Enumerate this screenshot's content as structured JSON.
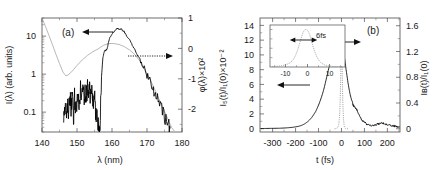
{
  "figure": {
    "background": "#ffffff",
    "curve_color_main": "#000000",
    "curve_color_secondary": "#9a9a9a"
  },
  "panel_a": {
    "label": "(a)",
    "arrow_left_label": "arrow-to-left-axis",
    "arrow_right_label": "arrow-to-right-axis"
  },
  "panel_b": {
    "label": "(b)",
    "arrow_left_label": "arrow-to-left-axis",
    "arrow_right_label": "arrow-to-right-axis",
    "inset": {
      "annotation": "6fs",
      "xticks": [
        "-10",
        "0",
        "10"
      ]
    }
  },
  "chart_data": [
    {
      "id": "panel-a",
      "type": "line",
      "title": "(a)",
      "xlabel": "λ (nm)",
      "ylabel": "I(λ) (arb. units)",
      "y2label": "φ(λ)×10²",
      "xlim": [
        140,
        180
      ],
      "xticks": [
        140,
        150,
        160,
        170,
        180
      ],
      "xtick_labels": [
        "140",
        "150",
        "160",
        "170",
        "180"
      ],
      "yscale": "log",
      "ylim": [
        0.03,
        30
      ],
      "yticks": [
        10,
        1,
        0.1
      ],
      "ytick_labels": [
        "10",
        "1",
        "0.1"
      ],
      "y2lim": [
        -2.75,
        1.0
      ],
      "y2ticks": [
        1,
        0,
        -1,
        -2
      ],
      "y2tick_labels": [
        "1",
        "0",
        "-1",
        "-2"
      ],
      "grid": false,
      "legend": false,
      "series": [
        {
          "name": "I(λ) spectrum",
          "axis": "left",
          "color": "#000000",
          "style": "solid-noisy",
          "x": [
            146.2,
            146.6,
            147.0,
            147.3,
            147.6,
            148.0,
            148.3,
            148.6,
            149.0,
            149.3,
            149.6,
            150.0,
            150.3,
            150.6,
            151.0,
            151.3,
            151.6,
            152.0,
            152.3,
            152.6,
            153.0,
            153.3,
            153.6,
            154.0,
            154.3,
            154.6,
            155.0,
            155.3,
            155.6,
            156.0,
            156.3,
            156.6,
            157.0,
            157.4,
            157.8,
            158.2,
            158.6,
            159.0,
            159.5,
            160.0,
            160.5,
            161.0,
            161.5,
            162.0,
            162.5,
            163.0,
            163.5,
            164.0,
            165.0,
            166.0,
            167.0,
            168.0,
            169.0,
            170.0,
            171.0,
            172.0,
            173.0,
            174.0,
            175.0,
            176.0,
            176.6
          ],
          "y": [
            0.055,
            0.16,
            0.055,
            0.2,
            0.09,
            0.34,
            0.11,
            0.28,
            0.08,
            0.3,
            0.1,
            0.2,
            0.32,
            0.12,
            0.45,
            0.22,
            0.5,
            0.28,
            0.45,
            0.3,
            0.52,
            0.33,
            0.42,
            0.26,
            0.38,
            0.2,
            0.3,
            0.12,
            0.09,
            0.05,
            0.05,
            0.06,
            0.9,
            2.6,
            4.0,
            4.2,
            4.6,
            7.0,
            9.5,
            11.5,
            13.0,
            14.5,
            15.8,
            15.0,
            16.0,
            14.0,
            13.0,
            11.0,
            8.0,
            5.5,
            3.6,
            2.4,
            1.55,
            1.0,
            0.62,
            0.38,
            0.23,
            0.14,
            0.085,
            0.05,
            0.038
          ]
        },
        {
          "name": "φ(λ) spectral phase",
          "axis": "right",
          "color": "#9a9a9a",
          "style": "solid",
          "x": [
            140.0,
            141.0,
            142.0,
            143.0,
            144.0,
            145.0,
            146.0,
            146.8,
            147.4,
            148.2,
            149.0,
            150.0,
            151.5,
            153.0,
            154.5,
            156.0,
            157.5,
            159.0,
            160.5,
            162.0,
            163.5,
            165.0,
            166.5,
            168.0,
            169.5,
            171.0,
            172.5,
            174.0,
            175.5,
            177.0,
            177.8
          ],
          "y": [
            1.0,
            0.72,
            0.42,
            0.12,
            -0.2,
            -0.5,
            -0.78,
            -0.9,
            -0.88,
            -0.8,
            -0.7,
            -0.56,
            -0.38,
            -0.23,
            -0.11,
            -0.02,
            0.1,
            0.16,
            0.16,
            0.13,
            0.06,
            -0.05,
            -0.2,
            -0.42,
            -0.72,
            -1.05,
            -1.42,
            -1.82,
            -2.2,
            -2.6,
            -2.72
          ]
        }
      ]
    },
    {
      "id": "panel-b",
      "type": "line",
      "title": "(b)",
      "xlabel": "t (fs)",
      "ylabel": "I₅(t)/I₁(0)×10⁻²",
      "y2label": "Iʙ(t)/I₁(0)",
      "xlim": [
        -355,
        255
      ],
      "xticks": [
        -300,
        -200,
        -100,
        0,
        100,
        200
      ],
      "xtick_labels": [
        "-300",
        "-200",
        "-100",
        "0",
        "100",
        "200"
      ],
      "ylim": [
        -0.45,
        15.0
      ],
      "yticks": [
        0,
        2,
        4,
        6,
        8,
        10,
        12,
        14
      ],
      "ytick_labels": [
        "0",
        "2",
        "4",
        "6",
        "8",
        "10",
        "12",
        "14"
      ],
      "y2lim": [
        -0.05,
        1.72
      ],
      "y2ticks": [
        0,
        0.4,
        0.8,
        1.2,
        1.6
      ],
      "y2tick_labels": [
        "0",
        "0.4",
        "0.8",
        "1.2",
        "1.6"
      ],
      "grid": false,
      "legend": false,
      "series": [
        {
          "name": "I₅(t)/I₁(0) harmonic pulse",
          "axis": "left",
          "color": "#000000",
          "style": "solid-noisy",
          "x": [
            -350,
            -330,
            -310,
            -290,
            -270,
            -250,
            -235,
            -220,
            -205,
            -190,
            -180,
            -170,
            -160,
            -150,
            -140,
            -130,
            -120,
            -112,
            -104,
            -96,
            -88,
            -80,
            -74,
            -68,
            -62,
            -56,
            -50,
            -45,
            -40,
            -36,
            -32,
            -28,
            -25,
            -22,
            -19,
            -16,
            -13,
            -11,
            -9,
            -7,
            -5,
            -3,
            -1,
            1,
            3,
            5,
            8,
            11,
            14,
            17,
            20,
            24,
            28,
            33,
            38,
            44,
            50,
            56,
            62,
            68,
            74,
            80,
            86,
            92,
            98,
            104,
            110,
            118,
            126,
            134,
            142,
            150,
            158,
            166,
            174,
            182,
            190,
            198,
            206,
            214,
            222,
            230,
            238,
            246,
            252
          ],
          "y": [
            0.02,
            0.03,
            0.04,
            0.05,
            0.06,
            0.09,
            0.12,
            0.16,
            0.22,
            0.3,
            0.38,
            0.5,
            0.66,
            0.88,
            1.15,
            1.5,
            1.95,
            2.35,
            2.9,
            3.5,
            4.2,
            5.0,
            5.7,
            6.5,
            7.3,
            8.1,
            8.9,
            9.4,
            9.8,
            10.0,
            10.15,
            10.0,
            10.6,
            10.3,
            11.0,
            10.6,
            11.2,
            10.8,
            11.5,
            11.0,
            11.7,
            11.2,
            11.6,
            11.0,
            11.4,
            10.8,
            10.4,
            10.0,
            9.4,
            8.8,
            8.0,
            7.2,
            6.3,
            5.4,
            4.6,
            3.9,
            3.3,
            2.9,
            2.75,
            2.6,
            2.1,
            1.7,
            1.35,
            1.1,
            0.95,
            0.8,
            0.6,
            0.45,
            0.4,
            0.45,
            0.5,
            0.55,
            0.62,
            0.68,
            0.72,
            0.7,
            0.66,
            0.6,
            0.52,
            0.45,
            0.4,
            0.35,
            0.3,
            0.26,
            0.24
          ]
        },
        {
          "name": "Iʙ(t)/I₁(0) driving pulse",
          "axis": "right",
          "color": "#8c8c8c",
          "style": "dotted",
          "x": [
            -30,
            -25,
            -20,
            -16,
            -13,
            -11,
            -9,
            -7.5,
            -6,
            -5,
            -4,
            -3,
            -2,
            -1,
            0,
            1,
            2,
            3,
            4,
            5,
            6,
            7.5,
            9,
            11,
            13,
            16,
            20,
            25,
            30
          ],
          "y": [
            0.0,
            0.0,
            0.01,
            0.02,
            0.05,
            0.09,
            0.17,
            0.26,
            0.4,
            0.53,
            0.7,
            0.88,
            1.06,
            1.22,
            1.3,
            1.26,
            1.12,
            0.94,
            0.74,
            0.56,
            0.4,
            0.25,
            0.15,
            0.07,
            0.03,
            0.01,
            0.0,
            0.0,
            0.0
          ]
        }
      ]
    },
    {
      "id": "panel-b-inset",
      "type": "line",
      "title": "",
      "xlabel": "",
      "ylabel": "",
      "annotation": "6fs",
      "xlim": [
        -17,
        17
      ],
      "xticks": [
        -10,
        0,
        10
      ],
      "xtick_labels": [
        "-10",
        "0",
        "10"
      ],
      "ylim": [
        0,
        1.12
      ],
      "grid": false,
      "legend": false,
      "series": [
        {
          "name": "autocorrelation trace",
          "color": "#8c8c8c",
          "style": "dotted",
          "x": [
            -16,
            -14,
            -12,
            -10.5,
            -9,
            -8,
            -7,
            -6.2,
            -5.5,
            -4.8,
            -4.2,
            -3.6,
            -3.0,
            -2.5,
            -2.0,
            -1.5,
            -1.0,
            -0.5,
            0,
            0.5,
            1.0,
            1.5,
            2.0,
            2.5,
            3.0,
            3.6,
            4.2,
            4.8,
            5.5,
            6.2,
            7.0,
            8.0,
            9.0,
            10.5,
            12,
            14,
            16
          ],
          "y": [
            0.01,
            0.02,
            0.03,
            0.05,
            0.08,
            0.11,
            0.16,
            0.22,
            0.3,
            0.4,
            0.5,
            0.62,
            0.74,
            0.84,
            0.92,
            0.97,
            1.0,
            1.0,
            0.98,
            0.93,
            0.86,
            0.77,
            0.67,
            0.56,
            0.46,
            0.36,
            0.28,
            0.21,
            0.15,
            0.11,
            0.08,
            0.05,
            0.035,
            0.02,
            0.013,
            0.008,
            0.005
          ]
        }
      ]
    }
  ]
}
